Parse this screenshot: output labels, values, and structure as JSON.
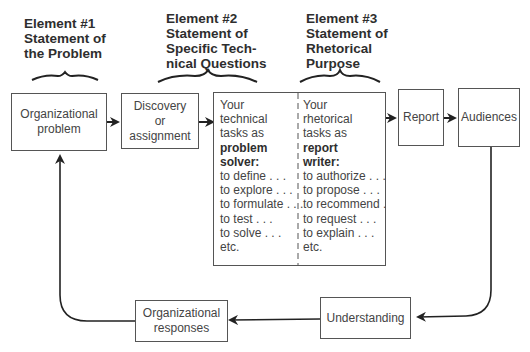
{
  "headings": [
    {
      "lines": [
        "Element #1",
        "Statement of",
        "the Problem"
      ]
    },
    {
      "lines": [
        "Element #2",
        "Statement of",
        "Specific Tech-",
        "nical Questions"
      ]
    },
    {
      "lines": [
        "Element #3",
        "Statement of",
        "Rhetorical",
        "Purpose"
      ]
    }
  ],
  "boxes": {
    "org_problem": {
      "lines": [
        "Organizational",
        "problem"
      ]
    },
    "discovery": {
      "lines": [
        "Discovery",
        "or",
        "assignment"
      ]
    },
    "report": {
      "label": "Report"
    },
    "audiences": {
      "label": "Audiences"
    },
    "understanding": {
      "label": "Understanding"
    },
    "org_responses": {
      "lines": [
        "Organizational",
        "responses"
      ]
    }
  },
  "tasks": {
    "technical": {
      "intro": [
        "Your",
        "technical",
        "tasks as"
      ],
      "role": [
        "problem",
        "solver:"
      ],
      "items": [
        "to define . . .",
        "to explore . . .",
        "to formulate . . .",
        "to test . . .",
        "to solve . . .",
        "etc."
      ]
    },
    "rhetorical": {
      "intro": [
        "Your",
        "rhetorical",
        "tasks as"
      ],
      "role": [
        "report",
        "writer:"
      ],
      "items": [
        "to authorize . . .",
        "to propose . . .",
        "to recommend .",
        "to request . . .",
        "to explain . . .",
        "etc."
      ]
    }
  }
}
